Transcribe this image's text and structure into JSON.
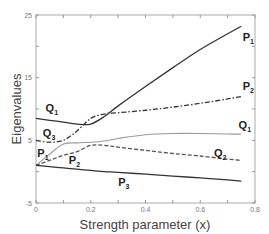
{
  "chart_data": {
    "type": "line",
    "title": "",
    "xlabel": "Strength parameter (x)",
    "ylabel": "Eigenvalues",
    "xlim": [
      0,
      0.8
    ],
    "ylim": [
      -5,
      25
    ],
    "grid": false,
    "x_ticks": [
      0,
      0.2,
      0.4,
      0.6,
      0.8
    ],
    "x_tick_labels": [
      "0",
      "0.2",
      "0.4",
      "0.6",
      "0.8"
    ],
    "y_ticks": [
      -5,
      5,
      15,
      25
    ],
    "y_tick_labels": [
      "-5",
      "5",
      "15",
      "25"
    ],
    "x": [
      0,
      0.05,
      0.1,
      0.15,
      0.2,
      0.25,
      0.3,
      0.4,
      0.5,
      0.6,
      0.7,
      0.75
    ],
    "series": [
      {
        "name": "Q1 → P1",
        "style": "solid",
        "color": "#333333",
        "values": [
          8.5,
          8.2,
          7.9,
          7.6,
          7.6,
          8.8,
          10.5,
          13.6,
          16.6,
          19.5,
          22.0,
          23.2
        ]
      },
      {
        "name": "Q3 → P2",
        "style": "dashdot",
        "color": "#333333",
        "values": [
          5.0,
          4.7,
          5.0,
          6.5,
          8.5,
          9.2,
          9.4,
          9.8,
          10.3,
          10.9,
          11.6,
          12.0
        ]
      },
      {
        "name": "P1 → Q1",
        "style": "solid",
        "color": "#999999",
        "values": [
          1.0,
          2.8,
          4.4,
          4.6,
          4.7,
          4.9,
          5.3,
          5.9,
          6.1,
          6.1,
          6.0,
          6.0
        ]
      },
      {
        "name": "P2 → Q2",
        "style": "dashed",
        "color": "#555555",
        "values": [
          1.0,
          1.8,
          2.6,
          3.2,
          4.2,
          4.2,
          3.9,
          3.4,
          2.9,
          2.5,
          2.0,
          1.8
        ]
      },
      {
        "name": "P3",
        "style": "solid",
        "color": "#333333",
        "values": [
          1.0,
          0.8,
          0.6,
          0.4,
          0.2,
          0.0,
          -0.1,
          -0.4,
          -0.7,
          -1.0,
          -1.3,
          -1.5
        ]
      }
    ],
    "annotations": [
      {
        "text": "P",
        "sub": "1",
        "x": 0.755,
        "y": 20.8
      },
      {
        "text": "P",
        "sub": "2",
        "x": 0.755,
        "y": 13.0
      },
      {
        "text": "Q",
        "sub": "1",
        "x": 0.74,
        "y": 6.8
      },
      {
        "text": "Q",
        "sub": "2",
        "x": 0.65,
        "y": 2.4
      },
      {
        "text": "P",
        "sub": "3",
        "x": 0.3,
        "y": -2.3
      },
      {
        "text": "Q",
        "sub": "1",
        "x": 0.035,
        "y": 9.6
      },
      {
        "text": "Q",
        "sub": "3",
        "x": 0.025,
        "y": 5.6
      },
      {
        "text": "P",
        "sub": "1",
        "x": 0.005,
        "y": 2.4
      },
      {
        "text": "P",
        "sub": "2",
        "x": 0.12,
        "y": 1.2
      }
    ]
  }
}
